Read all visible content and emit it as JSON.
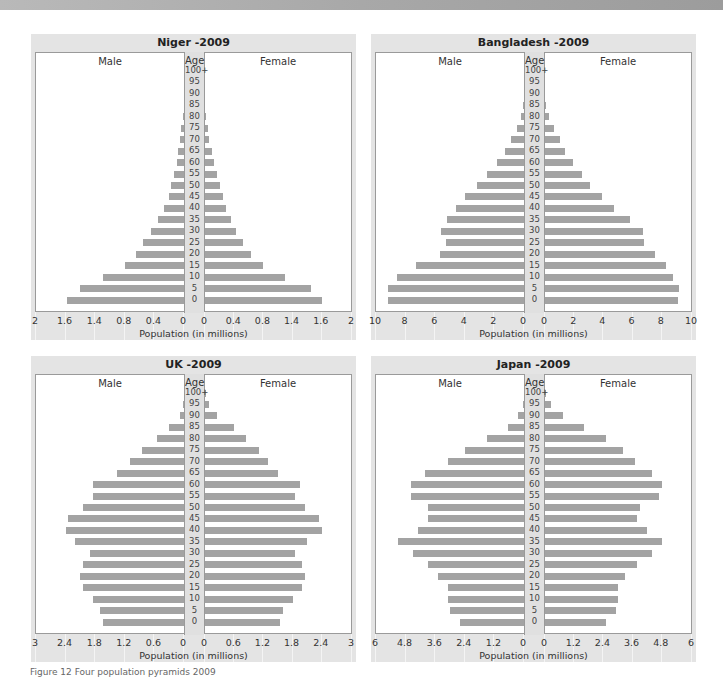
{
  "caption": "Figure 12 Four population pyramids 2009",
  "age_header": "Age",
  "male_label": "Male",
  "female_label": "Female",
  "xlabel": "Population (in millions)",
  "bar_color": "#a3a3a3",
  "panel_color": "#e4e4e4",
  "age_groups": [
    "0",
    "5",
    "10",
    "15",
    "20",
    "25",
    "30",
    "35",
    "40",
    "45",
    "50",
    "55",
    "60",
    "65",
    "70",
    "75",
    "80",
    "85",
    "90",
    "95",
    "100+"
  ],
  "chart_data": [
    {
      "type": "bar",
      "title": "Niger -2009",
      "xlabel": "Population (in millions)",
      "ylabel": "Age",
      "orientation": "horizontal-pyramid",
      "categories": [
        "0",
        "5",
        "10",
        "15",
        "20",
        "25",
        "30",
        "35",
        "40",
        "45",
        "50",
        "55",
        "60",
        "65",
        "70",
        "75",
        "80",
        "85",
        "90",
        "95",
        "100+"
      ],
      "xmax": 2,
      "tick_labels_left": [
        "2",
        "1.6",
        "1.4",
        "0.8",
        "0.4",
        "0"
      ],
      "tick_labels_right": [
        "0",
        "0.4",
        "0.8",
        "1.4",
        "1.6",
        "2"
      ],
      "series": [
        {
          "name": "Male",
          "values": [
            1.58,
            1.4,
            1.1,
            0.8,
            0.65,
            0.55,
            0.45,
            0.35,
            0.27,
            0.2,
            0.17,
            0.13,
            0.1,
            0.08,
            0.06,
            0.04,
            0.02,
            0,
            0,
            0,
            0
          ]
        },
        {
          "name": "Female",
          "values": [
            1.6,
            1.45,
            1.1,
            0.8,
            0.63,
            0.52,
            0.43,
            0.35,
            0.29,
            0.24,
            0.2,
            0.16,
            0.12,
            0.09,
            0.06,
            0.04,
            0.02,
            0,
            0,
            0,
            0
          ]
        }
      ],
      "grid": false
    },
    {
      "type": "bar",
      "title": "Bangladesh -2009",
      "xlabel": "Population (in millions)",
      "ylabel": "Age",
      "orientation": "horizontal-pyramid",
      "categories": [
        "0",
        "5",
        "10",
        "15",
        "20",
        "25",
        "30",
        "35",
        "40",
        "45",
        "50",
        "55",
        "60",
        "65",
        "70",
        "75",
        "80",
        "85",
        "90",
        "95",
        "100+"
      ],
      "xmax": 10,
      "tick_labels_left": [
        "10",
        "8",
        "6",
        "4",
        "2",
        "0"
      ],
      "tick_labels_right": [
        "0",
        "2",
        "4",
        "6",
        "8",
        "10"
      ],
      "series": [
        {
          "name": "Male",
          "values": [
            9.2,
            9.2,
            8.6,
            7.3,
            5.7,
            5.3,
            5.6,
            5.2,
            4.6,
            4.0,
            3.2,
            2.5,
            1.8,
            1.3,
            0.9,
            0.5,
            0.2,
            0.1,
            0,
            0,
            0
          ]
        },
        {
          "name": "Female",
          "values": [
            9.1,
            9.2,
            8.8,
            8.3,
            7.5,
            6.8,
            6.7,
            5.8,
            4.7,
            3.9,
            3.1,
            2.5,
            1.9,
            1.4,
            1.0,
            0.6,
            0.3,
            0.1,
            0,
            0,
            0
          ]
        }
      ],
      "grid": false
    },
    {
      "type": "bar",
      "title": "UK -2009",
      "xlabel": "Population (in millions)",
      "ylabel": "Age",
      "orientation": "horizontal-pyramid",
      "categories": [
        "0",
        "5",
        "10",
        "15",
        "20",
        "25",
        "30",
        "35",
        "40",
        "45",
        "50",
        "55",
        "60",
        "65",
        "70",
        "75",
        "80",
        "85",
        "90",
        "95",
        "100+"
      ],
      "xmax": 3,
      "tick_labels_left": [
        "3",
        "2.4",
        "1.8",
        "1.2",
        "0.6",
        "0"
      ],
      "tick_labels_right": [
        "0",
        "0.6",
        "1.2",
        "1.8",
        "2.4",
        "3"
      ],
      "series": [
        {
          "name": "Male",
          "values": [
            1.65,
            1.7,
            1.85,
            2.05,
            2.1,
            2.05,
            1.9,
            2.2,
            2.4,
            2.35,
            2.05,
            1.85,
            1.85,
            1.35,
            1.1,
            0.85,
            0.55,
            0.3,
            0.08,
            0.02,
            0
          ]
        },
        {
          "name": "Female",
          "values": [
            1.55,
            1.6,
            1.8,
            2.0,
            2.05,
            2.0,
            1.85,
            2.1,
            2.4,
            2.35,
            2.05,
            1.85,
            1.95,
            1.5,
            1.3,
            1.1,
            0.85,
            0.6,
            0.25,
            0.08,
            0.01
          ]
        }
      ],
      "grid": false
    },
    {
      "type": "bar",
      "title": "Japan -2009",
      "xlabel": "Population (in millions)",
      "ylabel": "Age",
      "orientation": "horizontal-pyramid",
      "categories": [
        "0",
        "5",
        "10",
        "15",
        "20",
        "25",
        "30",
        "35",
        "40",
        "45",
        "50",
        "55",
        "60",
        "65",
        "70",
        "75",
        "80",
        "85",
        "90",
        "95",
        "100+"
      ],
      "xmax": 6,
      "tick_labels_left": [
        "6",
        "4.8",
        "3.6",
        "2.4",
        "1.2",
        "0"
      ],
      "tick_labels_right": [
        "0",
        "1.2",
        "2.4",
        "3.6",
        "4.8",
        "6"
      ],
      "series": [
        {
          "name": "Male",
          "values": [
            2.6,
            3.0,
            3.1,
            3.1,
            3.5,
            3.9,
            4.5,
            5.1,
            4.3,
            3.9,
            3.9,
            4.6,
            4.6,
            4.0,
            3.1,
            2.4,
            1.5,
            0.65,
            0.25,
            0.06,
            0
          ]
        },
        {
          "name": "Female",
          "values": [
            2.5,
            2.9,
            3.0,
            3.0,
            3.3,
            3.8,
            4.4,
            4.8,
            4.2,
            3.8,
            3.9,
            4.7,
            4.8,
            4.4,
            3.7,
            3.2,
            2.5,
            1.6,
            0.75,
            0.25,
            0.02
          ]
        }
      ],
      "grid": false
    }
  ]
}
